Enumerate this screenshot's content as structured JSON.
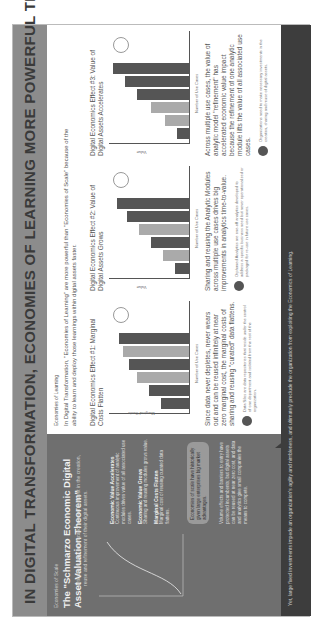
{
  "title": "IN DIGITAL TRANSFORMATION, ECONOMIES OF LEARNING MORE POWERFUL THAN ECONOMIES OF SCALE",
  "left": {
    "kicker": "Economies of Scale",
    "heading": "The \"Schmarzo Economic Digital Asset Valuation Theorem\"",
    "subtitle": "articulates why organizations need to invest in the creation, reuse and refinement of their digital assets.",
    "notes": [
      {
        "title": "Economic Value Accelerates",
        "text": "Continuous improvement of analytic modules drives value of all associated use cases."
      },
      {
        "title": "Economic Value Grows",
        "text": "Sharing and reusing modules grows value."
      },
      {
        "title": "Marginal Costs Flatten",
        "text": "Marginal cost of reusing curated data flattens."
      }
    ],
    "pill": "Economies of scale have historically given large enterprises big market advantages.",
    "notes2": "Volume effects and barriers to entry have protected incumbents; but digital assets can be reused at near zero cost, and data and analytics give small companies the means to compete."
  },
  "footer": "Yet, large fixed investments impede an organization's agility and nimbleness, and ultimately preclude the organization from exploiting the Economics of Learning.",
  "right": {
    "kicker": "Economies of Learning",
    "intro": "In Digital Transformation, \"Economies of Learning\" are more powerful than \"Economies of Scale\" because of the ability to learn and deploy those learnings within digital assets faster.",
    "effects": [
      {
        "title": "Digital Economics Effect #1: Marginal Costs Flatten",
        "ylabel": "Marginal Costs",
        "xlabel": "Number of Use Cases",
        "desc": "Since data never depletes, never wears out and can be reused infinitely at near zero marginal cost, the marginal costs of sharing and reusing \"curated\" data flattens.",
        "note": "Data Silos are data repositories that reside under the control of one department and isolated from the rest of the organization."
      },
      {
        "title": "Digital Economics Effect #2: Value of Digital Assets Grows",
        "ylabel": "Value",
        "xlabel": "Number of Use Cases",
        "desc": "Sharing and reusing the Analytic Modules across multiple use cases drives big improvements in analytics time-to-value.",
        "note": "Orphaned Analytics are one-off analytics developed to address a specific business need but never operationalized or packaged for re-use in future use cases."
      },
      {
        "title": "Digital Economics Effect #3: Value of Digital Assets Accelerates",
        "ylabel": "Value",
        "xlabel": "Number of Use Cases",
        "desc": "Across multiple use cases, the value of analytic model \"refinement\" has accelerated economic value impact because the refinement of one analytic module lifts the value of all associated use cases.",
        "note": "Organizations need to make necessary investments in the creation, sharing and reuse of digital assets."
      }
    ]
  }
}
